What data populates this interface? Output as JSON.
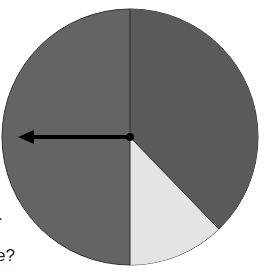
{
  "diagram": {
    "type": "spinner",
    "center": [
      130,
      137
    ],
    "radius": 128,
    "sections": [
      {
        "name": "right-dark",
        "start_deg": 0,
        "end_deg": 136,
        "color": "#5a5a5a"
      },
      {
        "name": "bottom-light",
        "start_deg": 136,
        "end_deg": 180,
        "color": "#e4e4e4"
      },
      {
        "name": "left-dark",
        "start_deg": 180,
        "end_deg": 360,
        "color": "#646464"
      }
    ],
    "arrow": {
      "direction": "left",
      "tip": [
        18,
        137
      ],
      "color": "#000000"
    },
    "text_fragments": [
      ".",
      "e?"
    ]
  }
}
